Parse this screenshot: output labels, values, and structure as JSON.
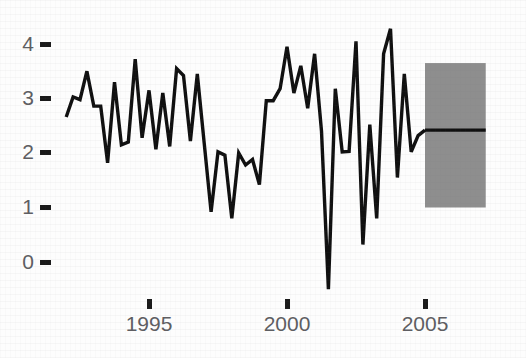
{
  "chart_data": {
    "type": "line",
    "title": "",
    "subtitle": "",
    "xlabel": "",
    "ylabel": "",
    "xlim": [
      1991.8,
      2007.2
    ],
    "ylim": [
      -0.85,
      4.45
    ],
    "grid": false,
    "legend": null,
    "x_ticks": [
      1995,
      2000,
      2005
    ],
    "x_tick_labels": [
      "1995",
      "2000",
      "2005"
    ],
    "y_ticks": [
      0,
      1,
      2,
      3,
      4
    ],
    "y_tick_labels": [
      "0",
      "1",
      "2",
      "3",
      "4"
    ],
    "series": [
      {
        "name": "observed",
        "color": "#101010",
        "x": [
          1992.0,
          1992.25,
          1992.5,
          1992.75,
          1993.0,
          1993.25,
          1993.5,
          1993.75,
          1994.0,
          1994.25,
          1994.5,
          1994.75,
          1995.0,
          1995.25,
          1995.5,
          1995.75,
          1996.0,
          1996.25,
          1996.5,
          1996.75,
          1997.0,
          1997.25,
          1997.5,
          1997.75,
          1998.0,
          1998.25,
          1998.5,
          1998.75,
          1999.0,
          1999.25,
          1999.5,
          1999.75,
          2000.0,
          2000.25,
          2000.5,
          2000.75,
          2001.0,
          2001.25,
          2001.5,
          2001.75,
          2002.0,
          2002.25,
          2002.5,
          2002.75,
          2003.0,
          2003.25,
          2003.5,
          2003.75,
          2004.0,
          2004.25,
          2004.5,
          2004.75,
          2005.0
        ],
        "y": [
          2.66,
          3.03,
          2.98,
          3.5,
          2.86,
          2.86,
          1.82,
          3.3,
          2.15,
          2.2,
          3.72,
          2.28,
          3.15,
          2.07,
          3.1,
          2.12,
          3.55,
          3.42,
          2.22,
          3.45,
          2.18,
          0.92,
          2.02,
          1.96,
          0.8,
          2.0,
          1.78,
          1.88,
          1.42,
          2.96,
          2.96,
          3.18,
          3.95,
          3.1,
          3.6,
          2.82,
          3.82,
          2.4,
          -0.5,
          3.18,
          2.02,
          2.03,
          4.05,
          0.32,
          2.52,
          0.8,
          3.82,
          4.28,
          1.55,
          3.45,
          2.02,
          2.32,
          2.42
        ]
      },
      {
        "name": "forecast",
        "color": "#101010",
        "x": [
          2005.0,
          2007.2
        ],
        "y": [
          2.42,
          2.42
        ]
      }
    ],
    "bands": [
      {
        "name": "forecast-uncertainty-band",
        "color": "#8e8e8e",
        "x_start": 2005.0,
        "x_end": 2007.2,
        "y_lower": 1.0,
        "y_upper": 3.65
      }
    ],
    "annotations": []
  },
  "axes": {
    "y_axis": {
      "name": "y-axis",
      "ticks": [
        {
          "label": "4",
          "value": 4
        },
        {
          "label": "3",
          "value": 3
        },
        {
          "label": "2",
          "value": 2
        },
        {
          "label": "1",
          "value": 1
        },
        {
          "label": "0",
          "value": 0
        }
      ]
    },
    "x_axis": {
      "name": "x-axis",
      "ticks": [
        {
          "label": "1995",
          "value": 1995
        },
        {
          "label": "2000",
          "value": 2000
        },
        {
          "label": "2005",
          "value": 2005
        }
      ]
    }
  }
}
